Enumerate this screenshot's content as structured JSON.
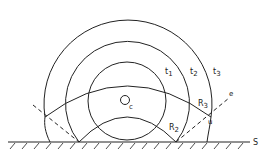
{
  "diagram": {
    "type": "wavefront-propagation",
    "source": {
      "label": "Q",
      "subscript": "c"
    },
    "surface_label": "S",
    "wavefronts": [
      {
        "label": "t1",
        "name": "t",
        "sub": "1"
      },
      {
        "label": "t2",
        "name": "t",
        "sub": "2"
      },
      {
        "label": "t3",
        "name": "t",
        "sub": "3"
      }
    ],
    "reflected_fronts": [
      {
        "label": "R2",
        "name": "R",
        "sub": "2"
      },
      {
        "label": "R3",
        "name": "R",
        "sub": "3"
      }
    ],
    "point_labels": {
      "u": "u",
      "e": "e"
    },
    "colors": {
      "stroke": "#222222",
      "background": "#ffffff"
    }
  }
}
